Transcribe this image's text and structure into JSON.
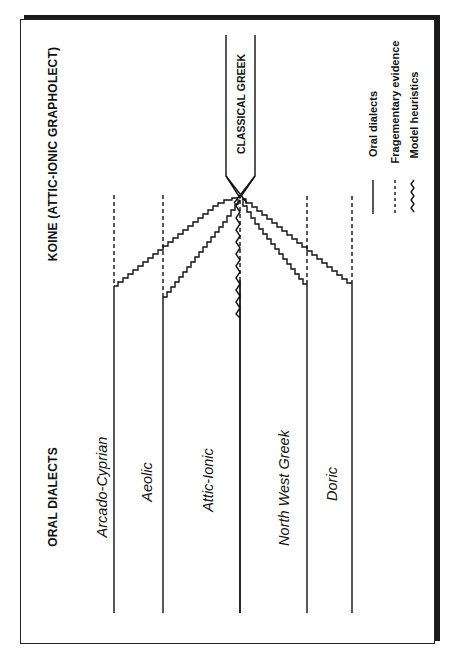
{
  "headers": {
    "koine": "KOINE (ATTIC-IONIC GRAPHOLECT)",
    "oral": "ORAL DIALECTS"
  },
  "classical_box": {
    "label": "CLASSICAL GREEK"
  },
  "dialects": [
    {
      "name": "Arcado-Cyprian",
      "x": 114,
      "dash_end": 286
    },
    {
      "name": "Aeolic",
      "x": 163,
      "dash_end": 297
    },
    {
      "name": "Attic-Ionic",
      "x": 240,
      "dash_end": 280
    },
    {
      "name": "North West Greek",
      "x": 307,
      "dash_end": 284
    },
    {
      "name": "Doric",
      "x": 352,
      "dash_end": 283
    }
  ],
  "legend": [
    {
      "symbol": "solid",
      "label": "Oral dialects"
    },
    {
      "symbol": "dashed",
      "label": "Fragementary evidence"
    },
    {
      "symbol": "wavy",
      "label": "Model heuristics"
    }
  ],
  "colors": {
    "ink": "#111111",
    "paper": "#ffffff"
  }
}
